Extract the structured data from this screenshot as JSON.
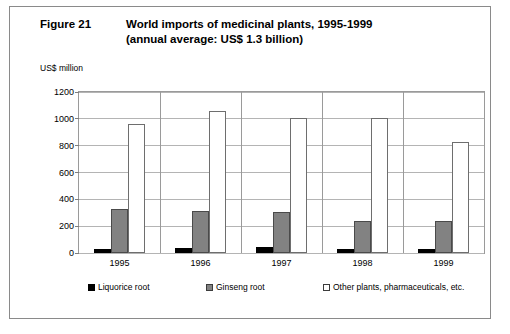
{
  "figure": {
    "number": "Figure 21",
    "title_line1": "World imports of medicinal plants, 1995-1999",
    "title_line2": "(annual average: US$ 1.3 billion)",
    "unit_label": "US$ million"
  },
  "chart_data": {
    "type": "bar",
    "title": "World imports of medicinal plants, 1995-1999 (annual average: US$ 1.3 billion)",
    "xlabel": "",
    "ylabel": "US$ million",
    "ylim": [
      0,
      1200
    ],
    "yticks": [
      0,
      200,
      400,
      600,
      800,
      1000,
      1200
    ],
    "ytick_labels": [
      "0",
      "200",
      "400",
      "600",
      "800",
      "1000",
      "1200"
    ],
    "categories": [
      "1995",
      "1996",
      "1997",
      "1998",
      "1999"
    ],
    "grid": true,
    "legend_position": "bottom",
    "series": [
      {
        "name": "Liquorice root",
        "color": "#000000",
        "values": [
          32,
          40,
          42,
          33,
          32
        ]
      },
      {
        "name": "Ginseng root",
        "color": "#828282",
        "values": [
          325,
          310,
          305,
          240,
          235
        ]
      },
      {
        "name": "Other plants, pharmaceuticals, etc.",
        "color": "#ffffff",
        "values": [
          960,
          1055,
          1008,
          1010,
          825
        ]
      }
    ]
  }
}
